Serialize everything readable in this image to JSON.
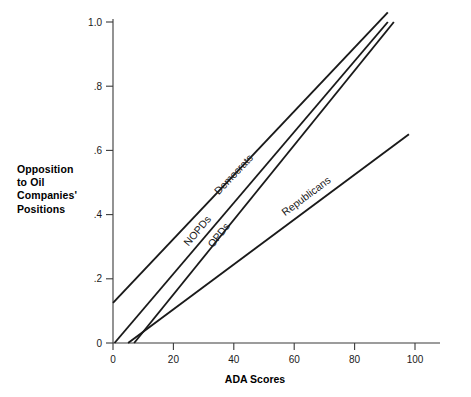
{
  "chart_data": {
    "type": "line",
    "title": "",
    "xlabel": "ADA Scores",
    "ylabel": "Opposition to Oil Companies' Positions",
    "ylabel_lines": [
      "Opposition",
      "to Oil",
      "Companies'",
      "Positions"
    ],
    "xlim": [
      0,
      108
    ],
    "ylim": [
      0,
      1.07
    ],
    "xticks": [
      0,
      20,
      40,
      60,
      80,
      100
    ],
    "xticklabels": [
      "0",
      "20",
      "40",
      "60",
      "80",
      "100"
    ],
    "yticks": [
      0,
      0.2,
      0.4,
      0.6,
      0.8,
      1.0
    ],
    "yticklabels": [
      "0",
      ".2",
      ".4",
      ".6",
      ".8",
      "1.0"
    ],
    "grid": false,
    "legend": "inline-labels-along-lines",
    "series": [
      {
        "name": "Democrats",
        "label": "Democrats",
        "x": [
          0,
          91
        ],
        "y": [
          0.125,
          1.03
        ],
        "slope": 0.00995,
        "intercept": 0.125,
        "label_x": 35,
        "label_y": 0.46
      },
      {
        "name": "NOPDs",
        "label": "NOPDs",
        "x": [
          0.5,
          91
        ],
        "y": [
          0.0,
          1.0
        ],
        "slope": 0.01105,
        "intercept": -0.0055,
        "label_x": 25,
        "label_y": 0.3
      },
      {
        "name": "OPDs",
        "label": "OPDs",
        "x": [
          7,
          93
        ],
        "y": [
          0.0,
          1.0
        ],
        "slope": 0.01163,
        "intercept": -0.0814,
        "label_x": 33,
        "label_y": 0.295
      },
      {
        "name": "Republicans",
        "label": "Republicans",
        "x": [
          5,
          98
        ],
        "y": [
          0.0,
          0.65
        ],
        "slope": 0.00699,
        "intercept": -0.0349,
        "label_x": 57,
        "label_y": 0.395
      }
    ]
  },
  "axis": {
    "x_title": "ADA Scores"
  }
}
